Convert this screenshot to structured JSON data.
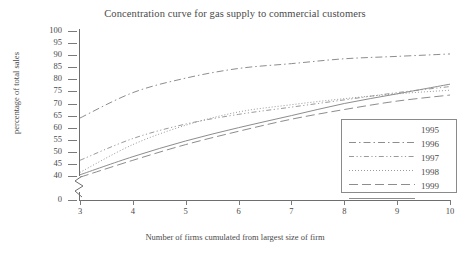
{
  "chart_data": {
    "type": "line",
    "title": "Concentration curve for gas supply to commercial customers",
    "xlabel": "Number of firms cumulated from largest size of firm",
    "ylabel": "percentage of total sales",
    "x": [
      3,
      4,
      5,
      6,
      7,
      8,
      9,
      10
    ],
    "xlim": [
      3,
      10
    ],
    "xticks": [
      "3",
      "4",
      "5",
      "6",
      "7",
      "8",
      "9",
      "10"
    ],
    "ylim": [
      40,
      100
    ],
    "yticks": [
      "100",
      "95",
      "90",
      "85",
      "80",
      "75",
      "70",
      "65",
      "60",
      "55",
      "50",
      "45",
      "40",
      "0"
    ],
    "y_axis_break": true,
    "y_break_between": [
      0,
      40
    ],
    "grid": false,
    "legend_position": "lower right",
    "series": [
      {
        "name": "1995",
        "dash": "dash-dot",
        "color": "#8d8d8d",
        "values": [
          64.0,
          74.5,
          80.5,
          84.5,
          86.5,
          88.5,
          89.5,
          90.5
        ]
      },
      {
        "name": "1996",
        "dash": "dash-dot-dot",
        "color": "#9a9a9a",
        "values": [
          46.5,
          55.5,
          61.5,
          65.5,
          68.5,
          71.5,
          74.5,
          77.0
        ]
      },
      {
        "name": "1997",
        "dash": "dotted",
        "color": "#9a9a9a",
        "values": [
          41.5,
          53.0,
          61.0,
          66.5,
          69.5,
          72.0,
          74.0,
          75.5
        ]
      },
      {
        "name": "1998",
        "dash": "long-dash",
        "color": "#8d8d8d",
        "values": [
          39.5,
          46.5,
          53.0,
          58.5,
          63.5,
          67.5,
          71.0,
          73.5
        ]
      },
      {
        "name": "1999",
        "dash": "solid",
        "color": "#8d8d8d",
        "values": [
          40.5,
          48.0,
          54.5,
          60.0,
          65.0,
          70.0,
          74.0,
          78.0
        ]
      }
    ]
  },
  "legend": {
    "entries": [
      "1995",
      "1996",
      "1997",
      "1998",
      "1999"
    ]
  }
}
